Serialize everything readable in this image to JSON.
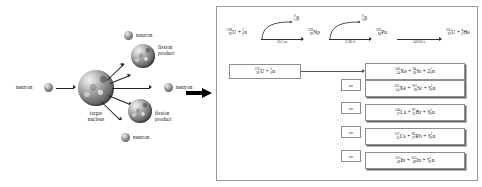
{
  "diagram": {
    "left_panel": {
      "name": "fission-event-illustration",
      "incoming_neutron_label": "neutron",
      "target_label_line1": "target",
      "target_label_line2": "nucleus",
      "products": [
        {
          "label": "neutron",
          "kind": "neutron"
        },
        {
          "label_line1": "fission",
          "label_line2": "product",
          "kind": "fission-product"
        },
        {
          "label": "neutron",
          "kind": "neutron"
        },
        {
          "label_line1": "fission",
          "label_line2": "product",
          "kind": "fission-product"
        },
        {
          "label": "neutron",
          "kind": "neutron"
        }
      ]
    },
    "transition_arrow": {
      "name": "flow-arrow",
      "direction": "right"
    },
    "right_panel": {
      "breeding_chain": {
        "name": "u238-to-pu239-breeding-chain",
        "start": {
          "mass": "238",
          "atomic": "92",
          "symbol": "U",
          "plus": "+",
          "projectile_mass": "1",
          "projectile_atomic": "0",
          "projectile_symbol": "n"
        },
        "steps": [
          {
            "decay_particle_mass": "0",
            "decay_particle_atomic": "-1",
            "decay_particle_symbol": "β",
            "half_life": "23.5 m",
            "product_mass": "239",
            "product_atomic": "93",
            "product_symbol": "Np"
          },
          {
            "decay_particle_mass": "0",
            "decay_particle_atomic": "-1",
            "decay_particle_symbol": "β",
            "half_life": "2.36 d",
            "product_mass": "239",
            "product_atomic": "94",
            "product_symbol": "Pu"
          },
          {
            "half_life": "24100 y",
            "product_mass": "235",
            "product_atomic": "92",
            "product_symbol": "U",
            "plus": "+",
            "emitted_mass": "4",
            "emitted_atomic": "2",
            "emitted_symbol": "He"
          }
        ]
      },
      "fission_input": {
        "name": "u235-plus-neutron-input",
        "mass": "235",
        "atomic": "92",
        "symbol": "U",
        "plus": "+",
        "neutron_mass": "1",
        "neutron_atomic": "0",
        "neutron_symbol": "n"
      },
      "or_label": "or",
      "outcomes": [
        {
          "id": "outcome-xe-sr",
          "a": {
            "mass": "140",
            "atomic": "54",
            "symbol": "Xe"
          },
          "op1": "+",
          "b": {
            "mass": "94",
            "atomic": "38",
            "symbol": "Sr"
          },
          "op2": "+",
          "c": {
            "count": "2",
            "mass": "1",
            "atomic": "0",
            "symbol": "n"
          }
        },
        {
          "id": "outcome-xe-sm",
          "a": {
            "mass": "132",
            "atomic": "54",
            "symbol": "Xe"
          },
          "op1": "+",
          "b": {
            "mass": "101",
            "atomic": "38",
            "symbol": "Sr"
          },
          "op2": "+",
          "c": {
            "count": "3",
            "mass": "1",
            "atomic": "0",
            "symbol": "n"
          }
        },
        {
          "id": "outcome-la-br",
          "a": {
            "mass": "146",
            "atomic": "57",
            "symbol": "La"
          },
          "op1": "+",
          "b": {
            "mass": "87",
            "atomic": "35",
            "symbol": "Br"
          },
          "op2": "+",
          "c": {
            "count": "3",
            "mass": "1",
            "atomic": "0",
            "symbol": "n"
          }
        },
        {
          "id": "outcome-cs-rb",
          "a": {
            "mass": "137",
            "atomic": "55",
            "symbol": "Cs"
          },
          "op1": "+",
          "b": {
            "mass": "96",
            "atomic": "37",
            "symbol": "Rb"
          },
          "op2": "+",
          "c": {
            "count": "3",
            "mass": "1",
            "atomic": "0",
            "symbol": "n"
          }
        },
        {
          "id": "outcome-in-in",
          "a": {
            "mass": "115",
            "atomic": "49",
            "symbol": "In"
          },
          "op1": "+",
          "b": {
            "mass": "115",
            "atomic": "49",
            "symbol": "In"
          },
          "op2": "+",
          "c": {
            "count": "5",
            "mass": "1",
            "atomic": "0",
            "symbol": "n"
          }
        }
      ]
    },
    "colors": {
      "panel_border": "#9a9a9a",
      "box_border": "#8d8d8d",
      "arrow": "#000000",
      "text": "#111111"
    }
  }
}
